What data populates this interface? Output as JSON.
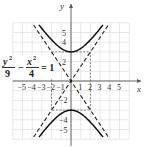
{
  "chart_data": {
    "type": "line",
    "title": "",
    "xlabel": "x",
    "ylabel": "y",
    "xlim": [
      -6,
      6
    ],
    "ylim": [
      -6,
      6
    ],
    "grid": true,
    "x_ticks": [
      "-5",
      "-4",
      "-3",
      "-2",
      "-1",
      "1",
      "2",
      "3",
      "4",
      "5"
    ],
    "y_ticks": [
      "5",
      "4",
      "2",
      "-2",
      "-4",
      "-5"
    ],
    "equation": {
      "num1": "y",
      "num1_exp": "2",
      "den1": "9",
      "minus": "−",
      "num2": "x",
      "num2_exp": "2",
      "den2": "4",
      "equals": "= 1"
    },
    "series": [
      {
        "name": "hyperbola upper branch",
        "equation": "y = 3*sqrt(1 + x^2/4)",
        "style": "solid",
        "vertex": [
          0,
          3
        ]
      },
      {
        "name": "hyperbola lower branch",
        "equation": "y = -3*sqrt(1 + x^2/4)",
        "style": "solid",
        "vertex": [
          0,
          -3
        ]
      },
      {
        "name": "asymptote",
        "equation": "y = 1.5x",
        "style": "dashed"
      },
      {
        "name": "asymptote",
        "equation": "y = -1.5x",
        "style": "dashed"
      }
    ],
    "reference_rectangle": {
      "x": [
        -2,
        2
      ],
      "y": [
        -3,
        3
      ],
      "style": "dashed"
    }
  }
}
